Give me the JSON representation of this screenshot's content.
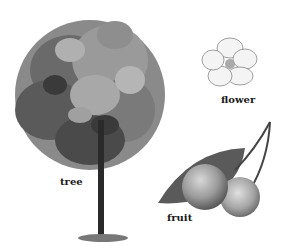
{
  "illustration": {
    "labels": {
      "tree": "tree",
      "flower": "flower",
      "fruit": "fruit"
    },
    "colors": {
      "background": "#ffffff",
      "foliage_dark": "#3a3a3a",
      "foliage_mid": "#7a7a7a",
      "foliage_light": "#a8a8a8",
      "trunk": "#2a2a2a",
      "petal": "#f2f2f2",
      "fruit": "#9a9a9a"
    }
  }
}
